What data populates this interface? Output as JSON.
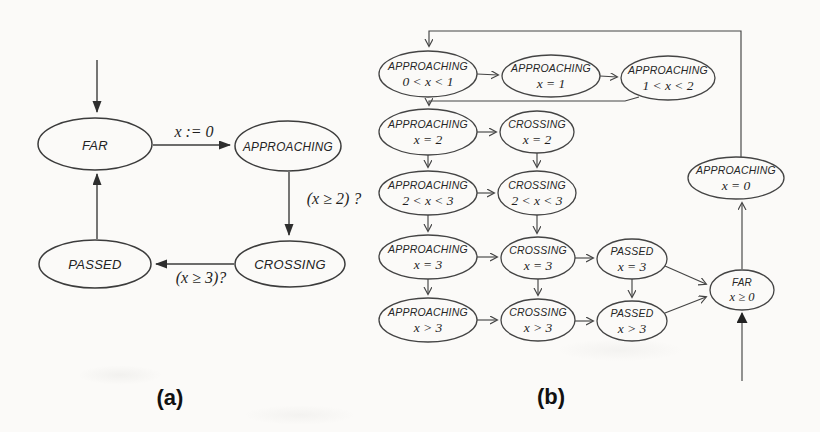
{
  "captions": {
    "a": "(a)",
    "b": "(b)"
  },
  "diagram_a": {
    "states": {
      "far": "FAR",
      "approaching": "APPROACHING",
      "crossing": "CROSSING",
      "passed": "PASSED"
    },
    "labels": {
      "far_to_approaching": "x := 0",
      "approaching_to_crossing": "(x ≥ 2) ?",
      "crossing_to_passed": "(x ≥ 3)?"
    }
  },
  "diagram_b": {
    "states": {
      "app_0x1": {
        "name": "APPROACHING",
        "cond": "0 < x < 1"
      },
      "app_x1": {
        "name": "APPROACHING",
        "cond": "x = 1"
      },
      "app_1x2": {
        "name": "APPROACHING",
        "cond": "1 < x < 2"
      },
      "app_x2": {
        "name": "APPROACHING",
        "cond": "x = 2"
      },
      "cross_x2": {
        "name": "CROSSING",
        "cond": "x = 2"
      },
      "app_2x3": {
        "name": "APPROACHING",
        "cond": "2 < x < 3"
      },
      "cross_2x3": {
        "name": "CROSSING",
        "cond": "2 < x < 3"
      },
      "app_x3": {
        "name": "APPROACHING",
        "cond": "x = 3"
      },
      "cross_x3": {
        "name": "CROSSING",
        "cond": "x = 3"
      },
      "pass_x3": {
        "name": "PASSED",
        "cond": "x = 3"
      },
      "app_gt3": {
        "name": "APPROACHING",
        "cond": "x > 3"
      },
      "cross_gt3": {
        "name": "CROSSING",
        "cond": "x > 3"
      },
      "pass_gt3": {
        "name": "PASSED",
        "cond": "x > 3"
      },
      "app_x0": {
        "name": "APPROACHING",
        "cond": "x = 0"
      },
      "far_ge0": {
        "name": "FAR",
        "cond": "x ≥ 0"
      }
    }
  },
  "colors": {
    "ink": "#3c3c3c",
    "background": "#fbfaf8"
  }
}
